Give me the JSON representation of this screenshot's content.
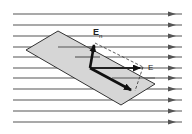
{
  "diagram": {
    "type": "electric-flux-through-tilted-surface",
    "field_lines": {
      "count": 11,
      "y_positions": [
        14,
        25,
        36,
        47,
        57,
        68,
        78,
        89,
        100,
        111,
        122
      ],
      "x_start": 13,
      "x_end": 182,
      "arrowhead_x": 172,
      "color": "#555555"
    },
    "surface": {
      "shape": "parallelogram",
      "points": "26,50 58,31 155,84 121,105",
      "fill": "#d6d6d6",
      "stroke": "#333333"
    },
    "vectors": {
      "origin": [
        90,
        68
      ],
      "normal": {
        "label": "E",
        "subscript": "n",
        "tip": [
          94,
          44
        ]
      },
      "field": {
        "label": "E",
        "tip": [
          143,
          68
        ]
      },
      "tangential": {
        "tip": [
          130,
          90
        ]
      }
    },
    "labels": {
      "en_main": "E",
      "en_sub": "n",
      "e_main": "E"
    }
  }
}
